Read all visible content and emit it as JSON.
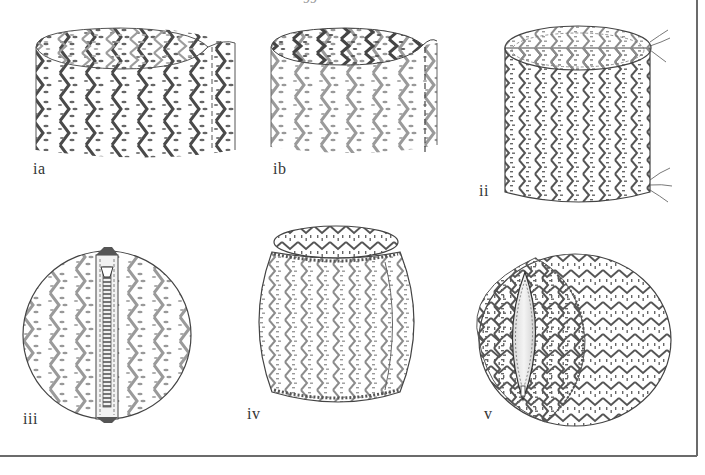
{
  "page": {
    "page_number_fragment": "99"
  },
  "figures": [
    {
      "id": "ia",
      "label": "ia",
      "description": "open fabric tube, pattern side outward, seam pinned"
    },
    {
      "id": "ib",
      "label": "ib",
      "description": "fabric tube turned, seam stitched (dashed line)"
    },
    {
      "id": "ii",
      "label": "ii",
      "description": "cylindrical cover with gathering threads at top and bottom"
    },
    {
      "id": "iii",
      "label": "iii",
      "description": "circular end panel with inserted zip"
    },
    {
      "id": "iv",
      "label": "iv",
      "description": "cover gathered over cushion form, top panel attached"
    },
    {
      "id": "v",
      "label": "v",
      "description": "finished round cushion with open zip showing inner pad"
    }
  ],
  "colors": {
    "ink": "#3a3a3a",
    "pattern_dark": "#4a4a4a",
    "pattern_mid": "#8a8a8a",
    "pattern_light": "#b5b5b5",
    "frame": "#6b6b6b",
    "background": "#ffffff"
  }
}
